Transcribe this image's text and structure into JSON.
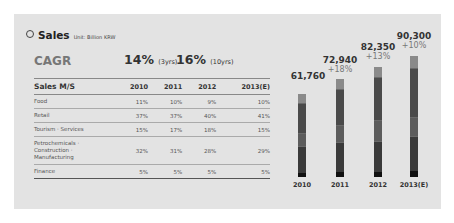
{
  "header": {
    "title": "Sales",
    "unit": "Unit: Billion KRW"
  },
  "cagr": {
    "label": "CAGR",
    "v1": "14%",
    "v1_note": "(3yrs)",
    "v2": "16%",
    "v2_note": "(10yrs)"
  },
  "table": {
    "headers": [
      "Sales M/S",
      "2010",
      "2011",
      "2012",
      "2013(E)"
    ],
    "rows": [
      [
        "Food",
        "11%",
        "10%",
        "9%",
        "10%"
      ],
      [
        "Retail",
        "37%",
        "37%",
        "40%",
        "41%"
      ],
      [
        "Tourism · Services",
        "15%",
        "17%",
        "18%",
        "15%"
      ],
      [
        "Petrochemicals · Construction · Manufacturing",
        "32%",
        "31%",
        "28%",
        "29%"
      ],
      [
        "Finance",
        "5%",
        "5%",
        "5%",
        "5%"
      ]
    ]
  },
  "chart_data": {
    "type": "bar",
    "title": "Sales",
    "unit": "Billion KRW",
    "categories": [
      "2010",
      "2011",
      "2012",
      "2013(E)"
    ],
    "values": [
      61760,
      72940,
      82350,
      90300
    ],
    "growth_labels": [
      "",
      "+18%",
      "+13%",
      "+10%"
    ],
    "stacked_share_series": [
      {
        "name": "Food",
        "values": [
          11,
          10,
          9,
          10
        ]
      },
      {
        "name": "Retail",
        "values": [
          37,
          37,
          40,
          41
        ]
      },
      {
        "name": "Tourism · Services",
        "values": [
          15,
          17,
          18,
          15
        ]
      },
      {
        "name": "Petrochemicals · Construction · Manufacturing",
        "values": [
          32,
          31,
          28,
          29
        ]
      },
      {
        "name": "Finance",
        "values": [
          5,
          5,
          5,
          5
        ]
      }
    ],
    "value_labels": [
      "61,760",
      "72,940",
      "82,350",
      "90,300"
    ],
    "grid": false,
    "legend": "none"
  },
  "colors": {
    "panel": "#e3e3e3",
    "food": "#8a8a8a",
    "retail": "#4a4a4a",
    "tourism": "#5c5c5c",
    "petro": "#3a3a3a",
    "finance": "#111111"
  }
}
